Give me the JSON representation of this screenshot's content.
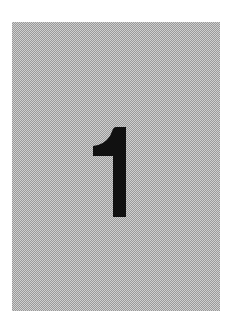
{
  "card": {
    "label": "1",
    "background_color": "#b4b4b4",
    "numeral_color": "#111111"
  }
}
